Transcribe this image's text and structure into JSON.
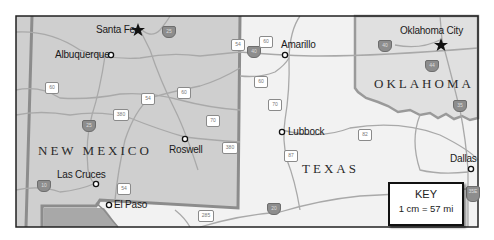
{
  "map": {
    "colors": {
      "background": "#ffffff",
      "frame": "#222222",
      "new_mexico_fill": "#cfcfcf",
      "oklahoma_fill": "#e0e0e0",
      "texas_fill": "#f2f2f2",
      "mexico_fill": "#a8a8a8",
      "state_border": "#8a8a8a",
      "road": "#a9a9a9"
    },
    "states": {
      "new_mexico": "NEW MEXICO",
      "texas": "TEXAS",
      "oklahoma": "OKLAHOMA"
    },
    "cities": [
      {
        "name": "Santa Fe",
        "type": "capital"
      },
      {
        "name": "Albuquerque",
        "type": "city"
      },
      {
        "name": "Roswell",
        "type": "city"
      },
      {
        "name": "Las Cruces",
        "type": "city"
      },
      {
        "name": "El Paso",
        "type": "city"
      },
      {
        "name": "Amarillo",
        "type": "city"
      },
      {
        "name": "Lubbock",
        "type": "city"
      },
      {
        "name": "Oklahoma City",
        "type": "capital"
      },
      {
        "name": "Dallas",
        "type": "city"
      }
    ],
    "highways": {
      "interstate": [
        "25",
        "40",
        "25",
        "10",
        "20",
        "44",
        "35",
        "35E"
      ],
      "us": [
        "54",
        "60",
        "54",
        "60",
        "380",
        "70",
        "380",
        "54",
        "285",
        "60",
        "60",
        "70",
        "87",
        "82"
      ]
    },
    "key": {
      "title": "KEY",
      "scale": "1 cm = 57 mi"
    }
  }
}
